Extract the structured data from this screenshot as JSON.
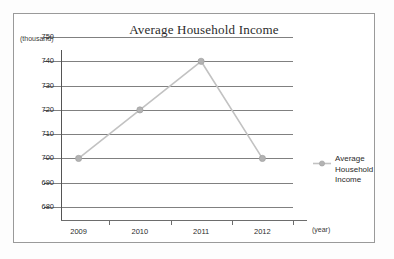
{
  "chart_data": {
    "type": "line",
    "title": "Average Household Income",
    "categories": [
      "2009",
      "2010",
      "2011",
      "2012"
    ],
    "values": [
      700,
      720,
      740,
      700
    ],
    "series": [
      {
        "name": "Average Household Income",
        "values": [
          700,
          720,
          740,
          700
        ]
      }
    ],
    "xlabel": "(year)",
    "ylabel": "(thousand)",
    "ylim": [
      680,
      750
    ],
    "yticks": [
      680,
      690,
      700,
      710,
      720,
      730,
      740,
      750
    ],
    "ytick_labels": [
      "680",
      "690",
      "700",
      "710",
      "720",
      "730",
      "740",
      "750"
    ],
    "grid": true,
    "legend_position": "right",
    "legend_entries": [
      "Average Household Income"
    ],
    "colors": {
      "series_line": "#c2c2c2",
      "series_marker": "#b3b3b3",
      "gridline": "#808080",
      "axis": "#555555",
      "text": "#2b2b2b",
      "frame": "#9a9a9a",
      "background": "#ffffff"
    }
  },
  "legend": {
    "line1": "Average",
    "line2": "Household",
    "line3": "Income"
  }
}
